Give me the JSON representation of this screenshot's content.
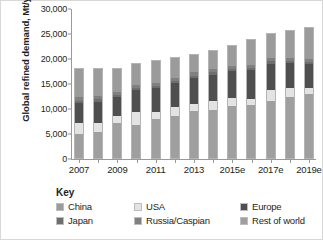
{
  "chart_data": {
    "type": "bar",
    "stacked": true,
    "title": "",
    "xlabel": "",
    "ylabel": "Global refined demand, Mt/year",
    "ylim": [
      0,
      30000
    ],
    "ytick_values": [
      0,
      5000,
      10000,
      15000,
      20000,
      25000,
      30000
    ],
    "ytick_labels": [
      "0",
      "5,000",
      "10,000",
      "15,000",
      "20,000",
      "25,000",
      "30,000"
    ],
    "grid": false,
    "legend_position": "below",
    "categories": [
      "2007",
      "2008",
      "2009",
      "2010",
      "2011",
      "2012",
      "2013",
      "2014",
      "2015e",
      "2016e",
      "2017e",
      "2018e",
      "2019e"
    ],
    "xtick_labels": [
      "2007",
      "",
      "2009",
      "",
      "2011",
      "",
      "2013",
      "",
      "2015e",
      "",
      "2017e",
      "",
      "2019e"
    ],
    "series": [
      {
        "name": "Rest of world",
        "color": "#9f9f9f",
        "values": [
          5000,
          5400,
          7200,
          6800,
          8000,
          8600,
          9600,
          9800,
          10600,
          10800,
          11600,
          12400,
          12900
        ]
      },
      {
        "name": "USA",
        "color": "#e3e3e3",
        "values": [
          2100,
          1700,
          1350,
          2500,
          1450,
          1800,
          1450,
          1750,
          1650,
          1200,
          2200,
          1900,
          1400
        ]
      },
      {
        "name": "Europe",
        "color": "#4f4f4f",
        "values": [
          4200,
          4450,
          3900,
          4550,
          4750,
          4950,
          5350,
          5450,
          5500,
          5800,
          5400,
          4900,
          4700
        ]
      },
      {
        "name": "Japan",
        "color": "#6e6e6e",
        "values": [
          450,
          430,
          400,
          400,
          420,
          430,
          420,
          420,
          420,
          420,
          420,
          420,
          420
        ]
      },
      {
        "name": "Russia/Caspian",
        "color": "#808080",
        "values": [
          650,
          620,
          600,
          600,
          620,
          630,
          630,
          630,
          640,
          650,
          660,
          670,
          680
        ]
      },
      {
        "name": "China",
        "color": "#9b9b9b",
        "values": [
          5800,
          5600,
          4750,
          4450,
          4500,
          4000,
          3650,
          3700,
          3900,
          5100,
          5000,
          5600,
          6400
        ]
      }
    ],
    "totals": [
      18200,
      18200,
      18200,
      19300,
      19740,
      20410,
      21100,
      21750,
      22710,
      23970,
      25280,
      25890,
      26500
    ],
    "legend_entries": [
      {
        "label": "China",
        "color": "#9b9b9b"
      },
      {
        "label": "USA",
        "color": "#e3e3e3"
      },
      {
        "label": "Europe",
        "color": "#4f4f4f"
      },
      {
        "label": "Japan",
        "color": "#6e6e6e"
      },
      {
        "label": "Russia/Caspian",
        "color": "#808080"
      },
      {
        "label": "Rest of world",
        "color": "#9f9f9f"
      }
    ]
  },
  "key": {
    "heading": "Key"
  }
}
